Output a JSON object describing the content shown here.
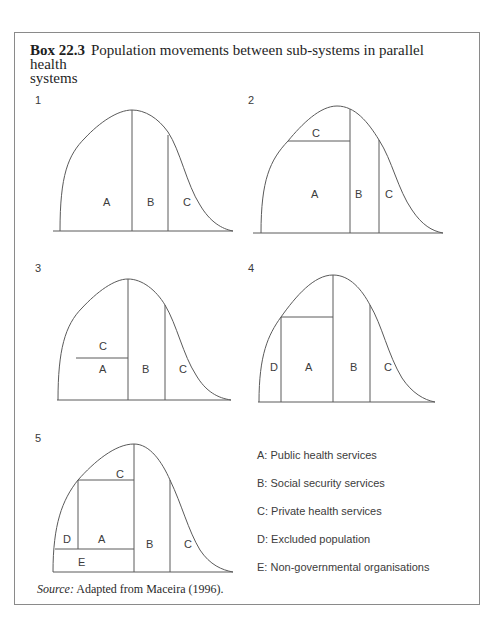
{
  "box": {
    "label": "Box 22.3",
    "title": "Population movements between sub-systems in parallel health systems",
    "title_line1": "Population movements between sub-systems in parallel health",
    "title_line2": "systems"
  },
  "diagrams": [
    {
      "number": "1",
      "regions": [
        {
          "label": "A"
        },
        {
          "label": "B"
        },
        {
          "label": "C"
        }
      ]
    },
    {
      "number": "2",
      "regions": [
        {
          "label": "C"
        },
        {
          "label": "A"
        },
        {
          "label": "B"
        },
        {
          "label": "C"
        }
      ]
    },
    {
      "number": "3",
      "regions": [
        {
          "label": "C"
        },
        {
          "label": "A"
        },
        {
          "label": "B"
        },
        {
          "label": "C"
        }
      ]
    },
    {
      "number": "4",
      "regions": [
        {
          "label": "D"
        },
        {
          "label": "A"
        },
        {
          "label": "B"
        },
        {
          "label": "C"
        }
      ]
    },
    {
      "number": "5",
      "regions": [
        {
          "label": "C"
        },
        {
          "label": "D"
        },
        {
          "label": "A"
        },
        {
          "label": "E"
        },
        {
          "label": "B"
        },
        {
          "label": "C"
        }
      ]
    }
  ],
  "legend": [
    {
      "key": "A",
      "text": "A: Public health services"
    },
    {
      "key": "B",
      "text": "B: Social security services"
    },
    {
      "key": "C",
      "text": "C: Private health services"
    },
    {
      "key": "D",
      "text": "D: Excluded population"
    },
    {
      "key": "E",
      "text": "E: Non-governmental organisations"
    }
  ],
  "source": {
    "label": "Source:",
    "text": "Adapted from Maceira (1996)."
  },
  "colors": {
    "line": "#5a5a5a",
    "border": "#8a8a8a",
    "text": "#3c3c3c"
  }
}
